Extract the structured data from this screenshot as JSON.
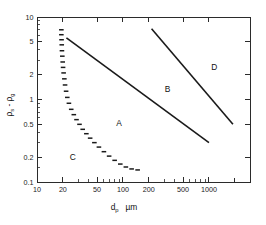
{
  "chart_data": {
    "type": "line",
    "title": "",
    "xlabel": "d_p  µm",
    "ylabel": "ρs - ρg",
    "xscale": "log",
    "yscale": "log",
    "xlim": [
      10,
      3000
    ],
    "ylim": [
      0.1,
      10
    ],
    "grid": false,
    "legend": null,
    "xticks": [
      10,
      20,
      50,
      100,
      200,
      500,
      1000
    ],
    "xticklabels": [
      "10",
      "20",
      "50",
      "100",
      "200",
      "500",
      "1000"
    ],
    "yticks": [
      10,
      5,
      2,
      1,
      0.5,
      0.2,
      0.1
    ],
    "yticklabels": [
      "10",
      "5",
      "2",
      "1",
      "0.5",
      "0.2",
      "0.1"
    ],
    "annotations": [
      {
        "text": "A",
        "x": 90,
        "y": 0.52
      },
      {
        "text": "B",
        "x": 330,
        "y": 1.35
      },
      {
        "text": "C",
        "x": 26,
        "y": 0.2
      },
      {
        "text": "D",
        "x": 1150,
        "y": 2.5
      }
    ],
    "series": [
      {
        "name": "A-B boundary",
        "style": "solid",
        "points": [
          [
            22,
            5.6
          ],
          [
            1000,
            0.3
          ]
        ]
      },
      {
        "name": "B-D boundary",
        "style": "solid",
        "points": [
          [
            215,
            7.2
          ],
          [
            1900,
            0.5
          ]
        ]
      },
      {
        "name": "C boundary",
        "style": "dashed",
        "points": [
          [
            19.2,
            7.0
          ],
          [
            19.2,
            6.1
          ],
          [
            19.3,
            5.3
          ],
          [
            19.4,
            4.6
          ],
          [
            19.5,
            3.9
          ],
          [
            19.7,
            3.35
          ],
          [
            19.9,
            2.85
          ],
          [
            20.1,
            2.45
          ],
          [
            20.4,
            2.1
          ],
          [
            20.8,
            1.78
          ],
          [
            21.2,
            1.5
          ],
          [
            21.8,
            1.26
          ],
          [
            22.5,
            1.06
          ],
          [
            23.5,
            0.9
          ],
          [
            25.0,
            0.76
          ],
          [
            26.8,
            0.655
          ],
          [
            28.8,
            0.57
          ],
          [
            31.2,
            0.5
          ],
          [
            34.0,
            0.435
          ],
          [
            37.5,
            0.385
          ],
          [
            41.5,
            0.34
          ],
          [
            46.5,
            0.3
          ],
          [
            52.5,
            0.265
          ],
          [
            60.0,
            0.233
          ],
          [
            69.0,
            0.206
          ],
          [
            80.0,
            0.183
          ],
          [
            93.0,
            0.165
          ],
          [
            108.0,
            0.152
          ],
          [
            126.0,
            0.144
          ],
          [
            148.0,
            0.14
          ]
        ]
      }
    ]
  },
  "axis_labels": {
    "x_main": "d",
    "x_sub": "p",
    "x_unit": "µm",
    "y_rho": "ρ",
    "y_sub_s": "s",
    "y_dash": "-",
    "y_sub_g": "g"
  }
}
